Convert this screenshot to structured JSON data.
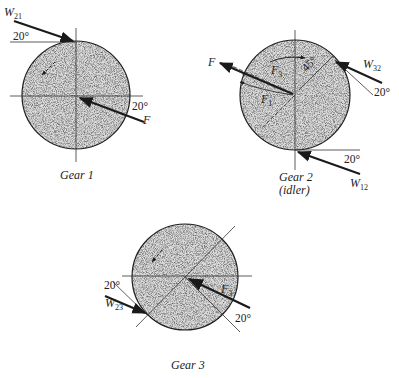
{
  "figure": {
    "gears": [
      {
        "id": "gear1",
        "caption": "Gear 1",
        "labels": {
          "w_main": "W",
          "w_sub": "21",
          "force": "F",
          "angle_top": "20°",
          "angle_right": "20°"
        }
      },
      {
        "id": "gear2",
        "caption": "Gear 2",
        "caption_sub": "(idler)",
        "labels": {
          "force": "F",
          "f3_main": "F",
          "f3_sub": "3",
          "f1_main": "F",
          "f1_sub": "1",
          "angle_45": "45°",
          "w32_main": "W",
          "w32_sub": "32",
          "angle_w32": "20°",
          "w12_main": "W",
          "w12_sub": "12",
          "angle_w12": "20°"
        }
      },
      {
        "id": "gear3",
        "caption": "Gear 3",
        "labels": {
          "force_main": "F",
          "force_sub": "3",
          "w23_main": "W",
          "w23_sub": "23",
          "angle_left": "20°",
          "angle_right": "20°"
        }
      }
    ],
    "colors": {
      "ink": "#1a1a1a",
      "gear_fill": "#d4d4d4",
      "background": "#ffffff"
    }
  }
}
